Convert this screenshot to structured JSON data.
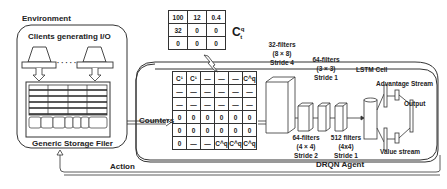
{
  "environment": {
    "title": "Environment",
    "clients_label": "Clients generating I/O",
    "ellipsis": "· · · · ·",
    "storage_label": "Generic Storage Filer"
  },
  "qtable": {
    "label_main": "C",
    "label_sup": "q",
    "label_sub": "t",
    "rows": [
      [
        "100",
        "12",
        "0.4"
      ],
      [
        "32",
        "0",
        "0"
      ],
      [
        "0",
        "0",
        "0"
      ]
    ]
  },
  "counters": {
    "label": "Counters",
    "rows": [
      [
        "C¹",
        "C¹",
        "—",
        "—",
        "—",
        "C^q"
      ],
      [
        "—",
        "—",
        "—",
        "—",
        "—",
        "—"
      ],
      [
        "—",
        "—",
        "—",
        "—",
        "—",
        "—"
      ],
      [
        "0",
        "0",
        "0",
        "0",
        "0",
        "0"
      ],
      [
        "0",
        "0",
        "0",
        "0",
        "0",
        "0"
      ],
      [
        "0",
        "—",
        "—",
        "C^q",
        "C^q",
        "C^q"
      ]
    ]
  },
  "agent": {
    "title": "DRQN Agent",
    "conv1": [
      "32-filters",
      "(8 × 8)",
      "Stride 4"
    ],
    "conv2": [
      "64-filters",
      "(4 × 4)",
      "Stride 2"
    ],
    "conv3": [
      "64-filters",
      "(3 × 3)",
      "Stride 1"
    ],
    "conv4": [
      "512 filters",
      "(4x4)",
      "Stride 1"
    ],
    "lstm": "LSTM Cell",
    "advantage": "Advantage Stream",
    "value": "Value stream",
    "output": "Output"
  },
  "action_label": "Action"
}
